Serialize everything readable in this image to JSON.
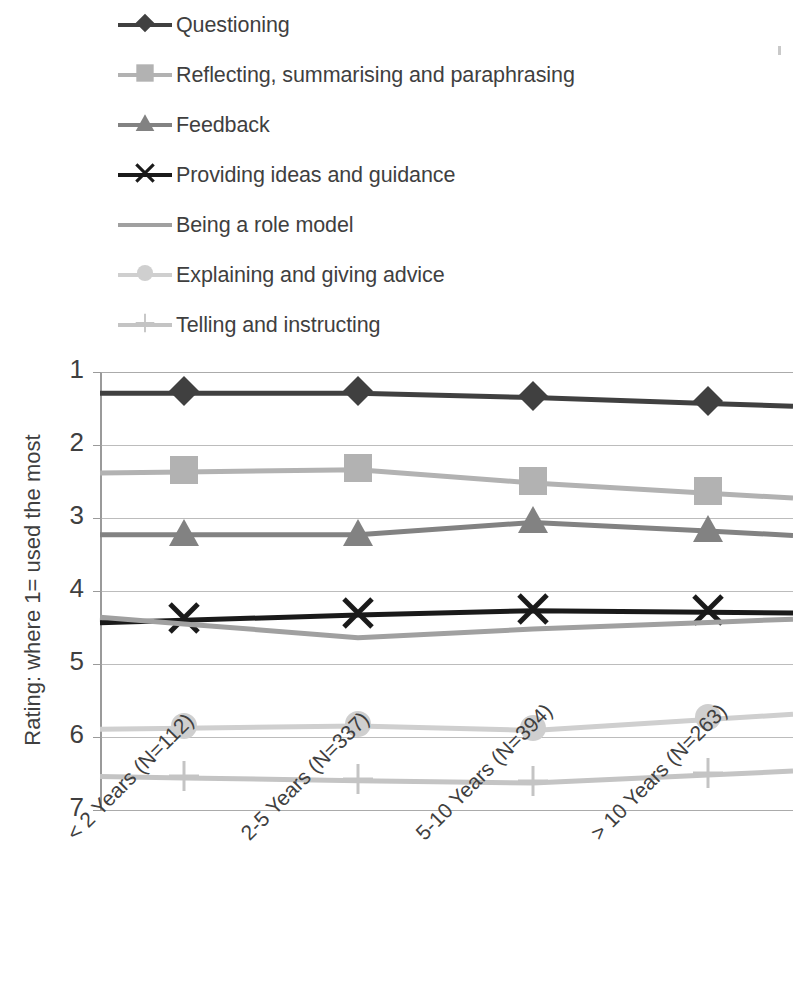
{
  "chart_data": {
    "type": "line",
    "title": "",
    "xlabel": "",
    "ylabel": "Rating: where 1= used the most",
    "ylim": [
      1,
      7
    ],
    "y_inverted": true,
    "grid": true,
    "legend_position": "top",
    "y_ticks": [
      "1",
      "2",
      "3",
      "4",
      "5",
      "6",
      "7"
    ],
    "categories": [
      "< 2 Years (N=112)",
      "2-5 Years (N=337)",
      "5-10 Years (N=394)",
      "> 10 Years (N=263)"
    ],
    "series": [
      {
        "name": "Questioning",
        "marker": "diamond-marker",
        "color": "#404040",
        "line_width": 5,
        "values": [
          1.29,
          1.29,
          1.35,
          1.43
        ]
      },
      {
        "name": "Reflecting, summarising and paraphrasing",
        "marker": "square-marker",
        "color": "#b2b2b2",
        "line_width": 5,
        "values": [
          2.37,
          2.34,
          2.52,
          2.66
        ]
      },
      {
        "name": "Feedback",
        "marker": "triangle-marker",
        "color": "#828282",
        "line_width": 5,
        "values": [
          3.23,
          3.23,
          3.06,
          3.18
        ]
      },
      {
        "name": "Providing ideas and guidance",
        "marker": "cross-marker",
        "color": "#1a1a1a",
        "line_width": 5,
        "values": [
          4.4,
          4.33,
          4.27,
          4.29
        ]
      },
      {
        "name": "Being a role model",
        "marker": "none",
        "color": "#a0a0a0",
        "line_width": 5,
        "values": [
          4.45,
          4.64,
          4.52,
          4.43
        ]
      },
      {
        "name": "Explaining and giving advice",
        "marker": "circle-marker",
        "color": "#cfcfcf",
        "line_width": 5,
        "values": [
          5.88,
          5.85,
          5.91,
          5.76
        ]
      },
      {
        "name": "Telling and instructing",
        "marker": "plus-marker",
        "color": "#c4c4c4",
        "line_width": 5,
        "values": [
          6.56,
          6.6,
          6.63,
          6.52
        ]
      }
    ]
  },
  "legend": {
    "items": [
      {
        "label": "Questioning"
      },
      {
        "label": "Reflecting, summarising and paraphrasing"
      },
      {
        "label": "Feedback"
      },
      {
        "label": "Providing ideas and guidance"
      },
      {
        "label": "Being a role model"
      },
      {
        "label": "Explaining and giving advice"
      },
      {
        "label": "Telling and instructing"
      }
    ]
  },
  "axes": {
    "y_title": "Rating: where 1= used the most"
  }
}
